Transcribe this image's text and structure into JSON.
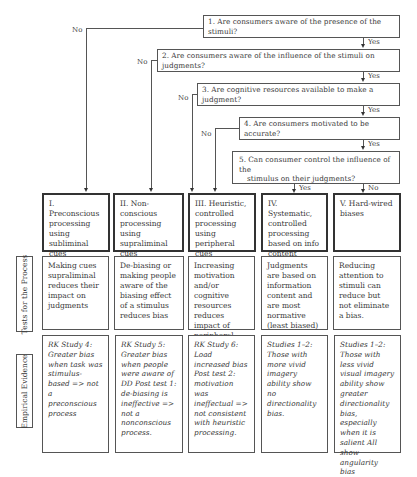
{
  "questions": [
    {
      "id": 1,
      "text": "1. Are consumers aware of the presence of the stimuli?"
    },
    {
      "id": 2,
      "text": "2. Are consumers aware of the influence of the stimuli on judgments?"
    },
    {
      "id": 3,
      "text": "3. Are cognitive resources available to make a judgment?"
    },
    {
      "id": 4,
      "text": "4. Are consumers motivated to be accurate?"
    },
    {
      "id": 5,
      "text_line1": "5. Can consumer control the influence of the",
      "text_line2": "stimulus on their judgments?"
    }
  ],
  "branch_labels": {
    "yes": "Yes",
    "no": "No"
  },
  "outcomes": [
    {
      "label": "I. Preconscious processing using subliminal cues"
    },
    {
      "label": "II. Non-conscious processing using supraliminal cues"
    },
    {
      "label": "III. Heuristic, controlled processing using peripheral cues"
    },
    {
      "label": "IV. Systematic, controlled processing based on info content"
    },
    {
      "label": "V. Hard-wired biases"
    }
  ],
  "rows": {
    "tests_label": "Tests for the Process",
    "evidence_label": "Empirical Evidence"
  },
  "tests": [
    "Making cues supraliminal reduces their impact on judgments",
    "De-biasing or making people aware of the biasing effect of a stimulus reduces bias",
    "Increasing motivation and/or cognitive resources reduces impact of peripheral cues (and bias)",
    "Judgments are based on information content and are most normative (least biased)",
    "Reducing attention to stimuli can reduce but not eliminate a bias."
  ],
  "evidence": [
    "RK Study 4: Greater bias when task was stimulus-based => not a preconscious process",
    "RK Study 5: Greater bias when people were aware of DD Post test 1: de-biasing is ineffective => not a nonconscious process.",
    "RK Study 6: Load increased bias Post test 2: motivation was ineffectual => not consistent with heuristic processing.",
    "Studies 1–2: Those with more vivid imagery ability show no directionality bias.",
    "Studies 1–2: Those with less vivid visual imagery ability show greater directionality bias, especially when it is salient All show angularity bias"
  ]
}
